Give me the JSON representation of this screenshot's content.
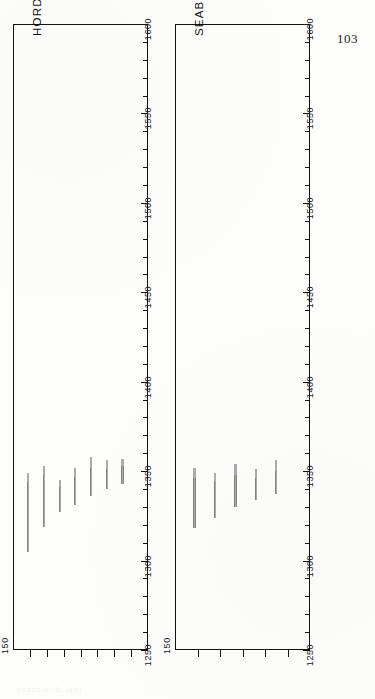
{
  "page": {
    "folio": "103",
    "background_color": "#fdfdfc",
    "ink_color": "#111111",
    "orientation_note": "landscape figure printed sideways on a portrait page"
  },
  "ghost": {
    "text": "Seaborough Hall"
  },
  "chart_data": [
    {
      "id": "hordon-on-the-hill",
      "type": "bar",
      "title": "HORDON ON THE HILL",
      "orientation": "horizontal",
      "xlabel": "",
      "ylabel": "",
      "xlim": [
        1250,
        1600
      ],
      "xticks_major": [
        1250,
        1300,
        1350,
        1400,
        1450,
        1500,
        1550,
        1600
      ],
      "xticks_minor": [
        1260,
        1270,
        1280,
        1290,
        1310,
        1320,
        1330,
        1340,
        1360,
        1370,
        1380,
        1390,
        1410,
        1420,
        1430,
        1440,
        1460,
        1470,
        1480,
        1490,
        1510,
        1520,
        1530,
        1540,
        1560,
        1570,
        1580,
        1590
      ],
      "tick_labels": [
        "1250",
        "1300",
        "1350",
        "1400",
        "1450",
        "1500",
        "1550",
        "1600"
      ],
      "category_axis_label": "150",
      "category_ticks": 7,
      "grid": false,
      "legend": "none",
      "categories": [
        "s1",
        "s2",
        "s3",
        "s4",
        "s5",
        "s6",
        "s7"
      ],
      "series": [
        {
          "name": "timber ring sequences",
          "bars": [
            {
              "category": "s1",
              "start": 1305,
              "end": 1349,
              "sapwood_from": 1344
            },
            {
              "category": "s2",
              "start": 1319,
              "end": 1353,
              "sapwood_from": 1348
            },
            {
              "category": "s3",
              "start": 1327,
              "end": 1345,
              "sapwood_from": 1341
            },
            {
              "category": "s4",
              "start": 1331,
              "end": 1352,
              "sapwood_from": 1347
            },
            {
              "category": "s5",
              "start": 1336,
              "end": 1358,
              "sapwood_from": 1352
            },
            {
              "category": "s6",
              "start": 1340,
              "end": 1356,
              "sapwood_from": 1351
            },
            {
              "category": "s7",
              "start": 1343,
              "end": 1357,
              "sapwood_from": 1353
            }
          ]
        }
      ]
    },
    {
      "id": "seaborough-hall",
      "type": "bar",
      "title": "SEABOROUGH HALL",
      "orientation": "horizontal",
      "xlabel": "",
      "ylabel": "",
      "xlim": [
        1250,
        1600
      ],
      "xticks_major": [
        1250,
        1300,
        1350,
        1400,
        1450,
        1500,
        1550,
        1600
      ],
      "xticks_minor": [
        1260,
        1270,
        1280,
        1290,
        1310,
        1320,
        1330,
        1340,
        1360,
        1370,
        1380,
        1390,
        1410,
        1420,
        1430,
        1440,
        1460,
        1470,
        1480,
        1490,
        1510,
        1520,
        1530,
        1540,
        1560,
        1570,
        1580,
        1590
      ],
      "tick_labels": [
        "1250",
        "1300",
        "1350",
        "1400",
        "1450",
        "1500",
        "1550",
        "1600"
      ],
      "category_axis_label": "150",
      "category_ticks": 5,
      "grid": false,
      "legend": "none",
      "categories": [
        "t1",
        "t2",
        "t3",
        "t4",
        "t5"
      ],
      "series": [
        {
          "name": "timber ring sequences",
          "bars": [
            {
              "category": "t1",
              "start": 1318,
              "end": 1352,
              "sapwood_from": 1346
            },
            {
              "category": "t2",
              "start": 1324,
              "end": 1349,
              "sapwood_from": 1344
            },
            {
              "category": "t3",
              "start": 1330,
              "end": 1354,
              "sapwood_from": 1348
            },
            {
              "category": "t4",
              "start": 1334,
              "end": 1351,
              "sapwood_from": 1346
            },
            {
              "category": "t5",
              "start": 1337,
              "end": 1356,
              "sapwood_from": 1350
            }
          ]
        }
      ]
    }
  ]
}
